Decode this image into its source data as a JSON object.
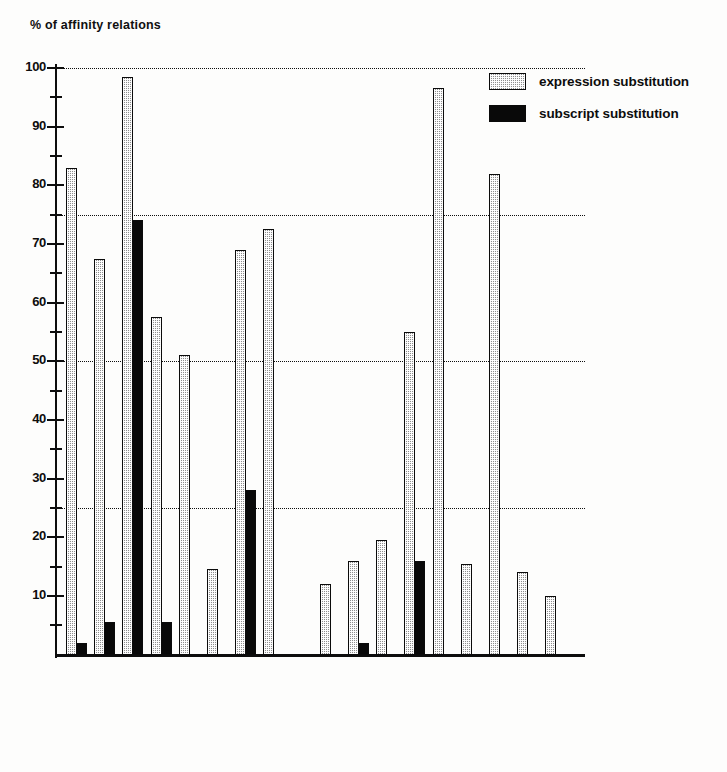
{
  "chart_data": {
    "type": "bar",
    "title": "% of affinity relations",
    "xlabel": "",
    "ylabel": "% of affinity relations",
    "ylim": [
      0,
      100
    ],
    "yticks": [
      10,
      20,
      30,
      40,
      50,
      60,
      70,
      80,
      90,
      100
    ],
    "ytick_labels": [
      "10",
      "20",
      "30",
      "40",
      "50",
      "60",
      "70",
      "80",
      "90",
      "100"
    ],
    "yminor_ticks": [
      5,
      15,
      25,
      35,
      45,
      55,
      65,
      75,
      85,
      95
    ],
    "gridlines": [
      25,
      50,
      75,
      100
    ],
    "grid": "horizontal-dotted",
    "legend_position": "top-right",
    "categories": [
      "ADM",
      "ARC2D",
      "BDNA",
      "DYFESM",
      "FLO52",
      "MDG",
      "MG3D",
      "OCEAN",
      "QCD",
      "SPEC77",
      "TRACK",
      "TRFD",
      "DODUC",
      "FPPPP",
      "HYDRO2D",
      "MDLJDP2",
      "SU2COR",
      "WAVE5"
    ],
    "series": [
      {
        "name": "expression substitution",
        "color": "#8e8e8e",
        "pattern": "checkered",
        "values": [
          83,
          67.5,
          98.5,
          57.5,
          51,
          14.5,
          69,
          72.5,
          0,
          12,
          16,
          19.5,
          55,
          96.5,
          15.5,
          82,
          14,
          10
        ]
      },
      {
        "name": "subscript substitution",
        "color": "#090909",
        "pattern": "solid",
        "values": [
          2,
          5.5,
          74,
          5.5,
          0,
          0,
          28,
          0,
          0,
          0,
          2,
          0,
          16,
          0,
          0,
          0,
          0,
          0
        ]
      }
    ]
  },
  "legend": {
    "items": [
      {
        "label": "expression substitution",
        "style": "expression"
      },
      {
        "label": "subscript substitution",
        "style": "subscript"
      }
    ]
  }
}
